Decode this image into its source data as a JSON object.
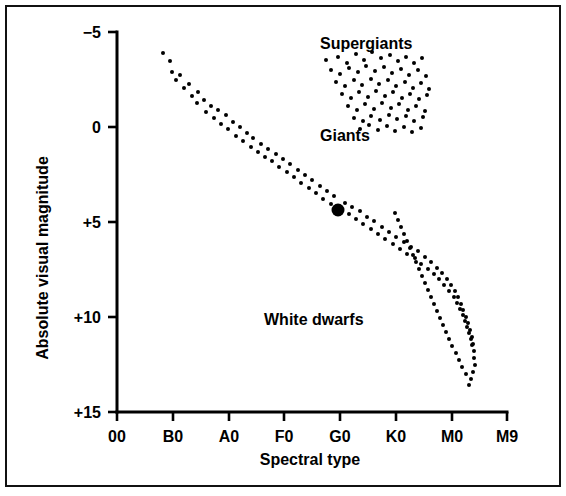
{
  "figure": {
    "kind": "hertzsprung-russell-diagram",
    "background_color": "#ffffff",
    "ink_color": "#000000",
    "border_color": "#111111"
  },
  "chart_data": {
    "type": "scatter",
    "title": "",
    "subtitle": "",
    "xlabel": "Spectral type",
    "ylabel": "Absolute visual magnitude",
    "grid": false,
    "legend_position": "none",
    "x_categories": [
      "00",
      "B0",
      "A0",
      "F0",
      "G0",
      "K0",
      "M0",
      "M9"
    ],
    "x_tick_labels": [
      "00",
      "B0",
      "A0",
      "F0",
      "G0",
      "K0",
      "M0",
      "M9"
    ],
    "y_tick_labels": [
      "−5",
      "0",
      "+5",
      "+10",
      "+15"
    ],
    "y_tick_values": [
      -5,
      0,
      5,
      10,
      15
    ],
    "ylim": [
      -5,
      15
    ],
    "y_axis_inverted": true,
    "xlim_index": [
      0,
      7
    ],
    "annotations": [
      {
        "text": "Supergiants",
        "x_category": "G0",
        "y_value": -4.1,
        "anchor": "start"
      },
      {
        "text": "Giants",
        "x_category": "G0",
        "y_value": 0.75,
        "anchor": "start"
      },
      {
        "text": "White dwarfs",
        "x_category": "F0",
        "y_value": 10.4,
        "anchor": "start"
      }
    ],
    "series": [
      {
        "name": "Main sequence",
        "marker": "small-dot",
        "marker_radius_px": 2,
        "points": [
          [
            163,
            53
          ],
          [
            170,
            61
          ],
          [
            172,
            72
          ],
          [
            176,
            80
          ],
          [
            180,
            75
          ],
          [
            184,
            88
          ],
          [
            189,
            84
          ],
          [
            192,
            96
          ],
          [
            197,
            103
          ],
          [
            198,
            92
          ],
          [
            204,
            100
          ],
          [
            206,
            112
          ],
          [
            211,
            106
          ],
          [
            214,
            118
          ],
          [
            218,
            110
          ],
          [
            221,
            124
          ],
          [
            226,
            115
          ],
          [
            228,
            129
          ],
          [
            233,
            122
          ],
          [
            236,
            136
          ],
          [
            240,
            127
          ],
          [
            243,
            141
          ],
          [
            247,
            133
          ],
          [
            251,
            147
          ],
          [
            253,
            138
          ],
          [
            258,
            152
          ],
          [
            261,
            144
          ],
          [
            265,
            157
          ],
          [
            268,
            149
          ],
          [
            272,
            161
          ],
          [
            276,
            154
          ],
          [
            279,
            167
          ],
          [
            283,
            159
          ],
          [
            287,
            172
          ],
          [
            290,
            164
          ],
          [
            294,
            177
          ],
          [
            298,
            170
          ],
          [
            301,
            183
          ],
          [
            305,
            175
          ],
          [
            309,
            188
          ],
          [
            312,
            180
          ],
          [
            316,
            193
          ],
          [
            320,
            186
          ],
          [
            323,
            199
          ],
          [
            327,
            191
          ],
          [
            331,
            204
          ],
          [
            334,
            196
          ],
          [
            345,
            203
          ],
          [
            349,
            214
          ],
          [
            352,
            207
          ],
          [
            356,
            219
          ],
          [
            360,
            211
          ],
          [
            363,
            224
          ],
          [
            367,
            217
          ],
          [
            371,
            229
          ],
          [
            374,
            221
          ],
          [
            378,
            234
          ],
          [
            382,
            227
          ],
          [
            385,
            239
          ],
          [
            389,
            232
          ],
          [
            393,
            244
          ],
          [
            396,
            237
          ],
          [
            400,
            249
          ],
          [
            404,
            242
          ],
          [
            407,
            254
          ],
          [
            411,
            247
          ],
          [
            415,
            258
          ],
          [
            418,
            251
          ],
          [
            421,
            264
          ],
          [
            425,
            257
          ],
          [
            428,
            269
          ],
          [
            431,
            262
          ],
          [
            434,
            274
          ],
          [
            437,
            268
          ],
          [
            439,
            279
          ],
          [
            442,
            273
          ],
          [
            444,
            285
          ],
          [
            447,
            279
          ],
          [
            449,
            291
          ],
          [
            451,
            285
          ],
          [
            454,
            297
          ],
          [
            455,
            291
          ],
          [
            457,
            303
          ],
          [
            458,
            297
          ],
          [
            460,
            309
          ],
          [
            461,
            304
          ],
          [
            463,
            315
          ],
          [
            463,
            310
          ],
          [
            465,
            321
          ],
          [
            466,
            317
          ],
          [
            467,
            327
          ],
          [
            468,
            323
          ],
          [
            469,
            333
          ],
          [
            470,
            330
          ],
          [
            471,
            339
          ],
          [
            472,
            337
          ],
          [
            472,
            345
          ],
          [
            473,
            344
          ],
          [
            474,
            351
          ],
          [
            474,
            358
          ],
          [
            475,
            365
          ],
          [
            473,
            372
          ],
          [
            471,
            379
          ],
          [
            469,
            385
          ],
          [
            466,
            374
          ],
          [
            462,
            367
          ],
          [
            459,
            360
          ],
          [
            456,
            353
          ],
          [
            452,
            346
          ],
          [
            449,
            339
          ],
          [
            446,
            332
          ],
          [
            443,
            325
          ],
          [
            440,
            318
          ],
          [
            437,
            311
          ],
          [
            434,
            304
          ],
          [
            431,
            297
          ],
          [
            428,
            290
          ],
          [
            425,
            283
          ],
          [
            422,
            276
          ],
          [
            419,
            269
          ],
          [
            416,
            262
          ],
          [
            413,
            255
          ],
          [
            410,
            248
          ],
          [
            407,
            241
          ],
          [
            404,
            234
          ],
          [
            401,
            227
          ],
          [
            398,
            220
          ],
          [
            395,
            213
          ]
        ]
      },
      {
        "name": "Giants and supergiants",
        "marker": "small-dot",
        "marker_radius_px": 2,
        "points": [
          [
            326,
            60
          ],
          [
            338,
            57
          ],
          [
            347,
            63
          ],
          [
            356,
            54
          ],
          [
            364,
            60
          ],
          [
            372,
            52
          ],
          [
            381,
            58
          ],
          [
            390,
            55
          ],
          [
            398,
            61
          ],
          [
            406,
            57
          ],
          [
            414,
            63
          ],
          [
            422,
            58
          ],
          [
            331,
            70
          ],
          [
            340,
            74
          ],
          [
            349,
            68
          ],
          [
            358,
            72
          ],
          [
            366,
            66
          ],
          [
            375,
            71
          ],
          [
            384,
            67
          ],
          [
            392,
            73
          ],
          [
            401,
            69
          ],
          [
            409,
            75
          ],
          [
            418,
            70
          ],
          [
            426,
            76
          ],
          [
            336,
            82
          ],
          [
            345,
            86
          ],
          [
            354,
            80
          ],
          [
            362,
            85
          ],
          [
            371,
            79
          ],
          [
            379,
            84
          ],
          [
            388,
            80
          ],
          [
            396,
            86
          ],
          [
            405,
            82
          ],
          [
            413,
            88
          ],
          [
            421,
            83
          ],
          [
            429,
            89
          ],
          [
            342,
            94
          ],
          [
            351,
            98
          ],
          [
            359,
            92
          ],
          [
            368,
            97
          ],
          [
            376,
            91
          ],
          [
            385,
            96
          ],
          [
            393,
            92
          ],
          [
            402,
            98
          ],
          [
            410,
            94
          ],
          [
            419,
            99
          ],
          [
            427,
            95
          ],
          [
            348,
            106
          ],
          [
            357,
            110
          ],
          [
            365,
            104
          ],
          [
            374,
            109
          ],
          [
            382,
            103
          ],
          [
            391,
            108
          ],
          [
            399,
            104
          ],
          [
            408,
            110
          ],
          [
            416,
            106
          ],
          [
            425,
            111
          ],
          [
            354,
            118
          ],
          [
            363,
            121
          ],
          [
            371,
            116
          ],
          [
            380,
            120
          ],
          [
            389,
            115
          ],
          [
            397,
            119
          ],
          [
            406,
            116
          ],
          [
            414,
            121
          ],
          [
            423,
            117
          ],
          [
            360,
            129
          ],
          [
            369,
            125
          ],
          [
            378,
            130
          ],
          [
            387,
            126
          ],
          [
            395,
            131
          ],
          [
            404,
            127
          ],
          [
            412,
            132
          ],
          [
            421,
            128
          ]
        ]
      },
      {
        "name": "Sun",
        "marker": "large-filled-dot",
        "marker_radius_px": 6.5,
        "points": [
          [
            338,
            210
          ]
        ],
        "x_category_approx": "G0",
        "y_value_approx": 4.8
      }
    ],
    "axis_geometry_px": {
      "x_axis_y": 412,
      "y_axis_x": 117,
      "x_tick_x": [
        117,
        173,
        229,
        284,
        340,
        396,
        452,
        507
      ],
      "y_tick_y": [
        32,
        127,
        222,
        317,
        412
      ],
      "tick_length": 9
    }
  }
}
